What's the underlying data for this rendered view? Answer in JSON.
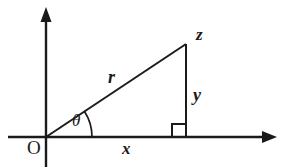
{
  "figure": {
    "type": "right-triangle-trigonometry-diagram",
    "background_color": "#ffffff",
    "stroke_color": "#1a1a1a",
    "labels": {
      "origin": "O",
      "hypotenuse": "r",
      "vertical_leg": "y",
      "horizontal_leg": "x",
      "angle": "θ",
      "apex_point": "z"
    },
    "geometry": {
      "origin_px": [
        46,
        137
      ],
      "apex_px": [
        186,
        44
      ],
      "foot_px": [
        186,
        137
      ],
      "x_axis_px": [
        8,
        137,
        283,
        137
      ],
      "y_axis_px": [
        46,
        10,
        46,
        167
      ],
      "right_angle_marker_px": [
        172,
        124,
        14,
        13
      ],
      "angle_arc_radius_px": 46
    },
    "axes": {
      "x_axis_arrow": "arrow-right",
      "y_axis_arrow": "arrow-up"
    }
  }
}
